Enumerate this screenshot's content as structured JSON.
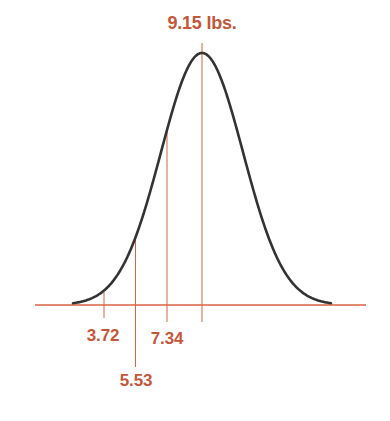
{
  "chart_data": {
    "type": "line",
    "title": "9.15 lbs.",
    "xlabel": "",
    "ylabel": "",
    "grid": false,
    "mean": 9.15,
    "mean_label": "9.15 lbs.",
    "std_dev_estimate": 1.81,
    "markers": [
      {
        "value": 3.72,
        "label": "3.72"
      },
      {
        "value": 5.53,
        "label": "5.53"
      },
      {
        "value": 7.34,
        "label": "7.34"
      },
      {
        "value": 9.15,
        "label": "9.15 lbs."
      }
    ],
    "colors": {
      "curve": "#333333",
      "axis": "#d9633f",
      "marker_lines": "#d9633f",
      "labels": "#c4573a"
    }
  },
  "labels": {
    "title": "9.15 lbs.",
    "m1": "3.72",
    "m2": "5.53",
    "m3": "7.34"
  }
}
